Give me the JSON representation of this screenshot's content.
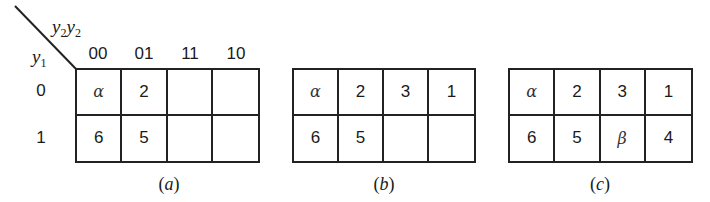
{
  "figure": {
    "axis_labels": {
      "columns_var": "y",
      "columns_sub_1": "2",
      "columns_var_2": "y",
      "columns_sub_2": "2",
      "rows_var": "y",
      "rows_sub": "1"
    },
    "column_headers": [
      "00",
      "01",
      "11",
      "10"
    ],
    "row_headers": [
      "0",
      "1"
    ],
    "panels": [
      {
        "caption_open": "(",
        "caption_letter": "a",
        "caption_close": ")",
        "rows": [
          [
            "α",
            "2",
            "",
            ""
          ],
          [
            "6",
            "5",
            "",
            ""
          ]
        ]
      },
      {
        "caption_open": "(",
        "caption_letter": "b",
        "caption_close": ")",
        "rows": [
          [
            "α",
            "2",
            "3",
            "1"
          ],
          [
            "6",
            "5",
            "",
            ""
          ]
        ]
      },
      {
        "caption_open": "(",
        "caption_letter": "c",
        "caption_close": ")",
        "rows": [
          [
            "α",
            "2",
            "3",
            "1"
          ],
          [
            "6",
            "5",
            "β",
            "4"
          ]
        ]
      }
    ]
  }
}
